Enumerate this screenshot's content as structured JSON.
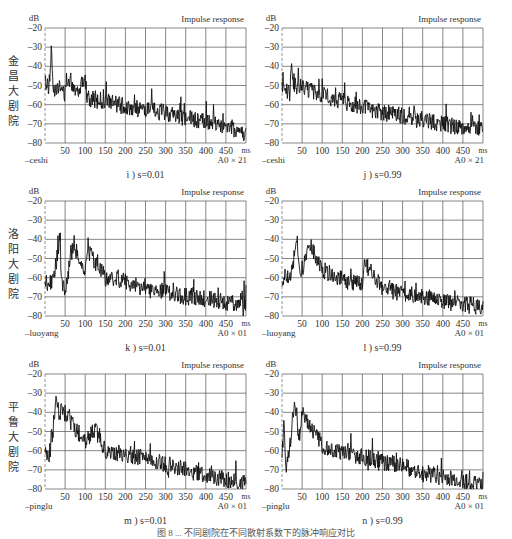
{
  "figure": {
    "caption": "图 8 ... 不同剧院在不同散射系数下的脉冲响应对比"
  },
  "venues": [
    {
      "id": "ceshi",
      "name": "金昌大剧院",
      "chars": [
        "金",
        "昌",
        "大",
        "剧",
        "院"
      ],
      "tag": "–ceshi",
      "scale": "A0 × 21"
    },
    {
      "id": "luoyang",
      "name": "洛阳大剧院",
      "chars": [
        "洛",
        "阳",
        "大",
        "剧",
        "院"
      ],
      "tag": "–luoyang",
      "scale": "A0 × 01"
    },
    {
      "id": "pinglu",
      "name": "平鲁大剧院",
      "chars": [
        "平",
        "鲁",
        "大",
        "剧",
        "院"
      ],
      "tag": "–pinglu",
      "scale": "A0 × 01"
    }
  ],
  "axis": {
    "y_unit": "dB",
    "x_unit": "ms",
    "y_ticks": [
      "-20",
      "-30",
      "-40",
      "-50",
      "-60",
      "-70",
      "-80"
    ],
    "x_ticks": [
      "50",
      "100",
      "150",
      "200",
      "250",
      "300",
      "350",
      "400",
      "450"
    ]
  },
  "chart_data": [
    {
      "panel": "i",
      "type": "line",
      "title": "Impulse response",
      "caption": "i ) s=0.01",
      "venue": "ceshi",
      "xlabel": "ms",
      "ylabel": "dB",
      "xlim": [
        0,
        500
      ],
      "ylim": [
        -80,
        -20
      ],
      "grid": true,
      "x": [
        0,
        10,
        16,
        20,
        30,
        50,
        60,
        80,
        100,
        105,
        150,
        200,
        250,
        300,
        350,
        400,
        450,
        500
      ],
      "values": [
        -48,
        -51,
        -31,
        -52,
        -50,
        -54,
        -46,
        -53,
        -45,
        -57,
        -58,
        -61,
        -63,
        -64,
        -67,
        -69,
        -71,
        -75
      ]
    },
    {
      "panel": "j",
      "type": "line",
      "title": "Impulse response",
      "caption": "j ) s=0.99",
      "venue": "ceshi",
      "xlabel": "ms",
      "ylabel": "dB",
      "xlim": [
        0,
        500
      ],
      "ylim": [
        -80,
        -20
      ],
      "grid": true,
      "x": [
        0,
        10,
        20,
        22,
        30,
        50,
        100,
        150,
        200,
        250,
        300,
        350,
        400,
        450,
        500
      ],
      "values": [
        -49,
        -53,
        -54,
        -36,
        -50,
        -51,
        -55,
        -58,
        -61,
        -64,
        -66,
        -68,
        -70,
        -72,
        -73
      ]
    },
    {
      "panel": "k",
      "type": "line",
      "title": "Impulse response",
      "caption": "k ) s=0.01",
      "venue": "luoyang",
      "xlabel": "ms",
      "ylabel": "dB",
      "xlim": [
        0,
        500
      ],
      "ylim": [
        -80,
        -20
      ],
      "grid": true,
      "x": [
        0,
        20,
        38,
        40,
        50,
        70,
        80,
        100,
        105,
        150,
        200,
        250,
        300,
        350,
        400,
        450,
        500
      ],
      "values": [
        -62,
        -63,
        -38,
        -60,
        -67,
        -43,
        -47,
        -60,
        -45,
        -60,
        -62,
        -66,
        -67,
        -70,
        -71,
        -73,
        -74
      ]
    },
    {
      "panel": "l",
      "type": "line",
      "title": "Impulse response",
      "caption": "l ) s=0.99",
      "venue": "luoyang",
      "xlabel": "ms",
      "ylabel": "dB",
      "xlim": [
        0,
        500
      ],
      "ylim": [
        -80,
        -20
      ],
      "grid": true,
      "x": [
        0,
        10,
        20,
        38,
        40,
        50,
        68,
        100,
        150,
        200,
        205,
        250,
        300,
        350,
        400,
        450,
        500
      ],
      "values": [
        -63,
        -58,
        -62,
        -38,
        -52,
        -58,
        -42,
        -56,
        -61,
        -64,
        -52,
        -66,
        -68,
        -70,
        -72,
        -74,
        -75
      ]
    },
    {
      "panel": "m",
      "type": "line",
      "title": "Impulse response",
      "caption": "m ) s=0.01",
      "venue": "pinglu",
      "xlabel": "ms",
      "ylabel": "dB",
      "xlim": [
        0,
        500
      ],
      "ylim": [
        -80,
        -20
      ],
      "grid": true,
      "x": [
        0,
        10,
        28,
        35,
        45,
        55,
        70,
        100,
        125,
        150,
        200,
        250,
        300,
        350,
        400,
        450,
        500
      ],
      "values": [
        -58,
        -64,
        -35,
        -40,
        -39,
        -42,
        -47,
        -55,
        -49,
        -60,
        -62,
        -64,
        -67,
        -70,
        -73,
        -75,
        -77
      ]
    },
    {
      "panel": "n",
      "type": "line",
      "title": "Impulse response",
      "caption": "n ) s=0.99",
      "venue": "pinglu",
      "xlabel": "ms",
      "ylabel": "dB",
      "xlim": [
        0,
        500
      ],
      "ylim": [
        -80,
        -20
      ],
      "grid": true,
      "x": [
        0,
        5,
        10,
        20,
        30,
        45,
        50,
        65,
        100,
        150,
        200,
        250,
        300,
        350,
        400,
        450,
        500
      ],
      "values": [
        -60,
        -48,
        -68,
        -58,
        -36,
        -55,
        -38,
        -45,
        -57,
        -61,
        -63,
        -66,
        -68,
        -71,
        -74,
        -76,
        -77
      ]
    }
  ]
}
